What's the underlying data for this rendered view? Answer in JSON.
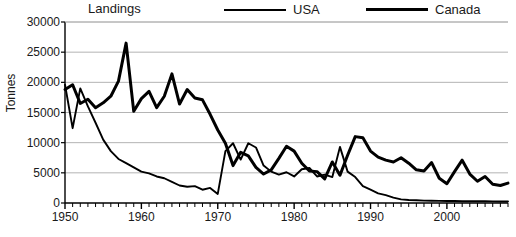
{
  "chart_data": {
    "type": "line",
    "title": "Landings",
    "xlabel": "",
    "ylabel": "Tonnes",
    "xlim": [
      1950,
      2008
    ],
    "ylim": [
      0,
      30000
    ],
    "ytick_labels": [
      "30000",
      "25000",
      "20000",
      "15000",
      "10000",
      "5000",
      "0"
    ],
    "ytick_values": [
      30000,
      25000,
      20000,
      15000,
      10000,
      5000,
      0
    ],
    "xtick_labels": [
      "1950",
      "1960",
      "1970",
      "1980",
      "1990",
      "2000"
    ],
    "xtick_values": [
      1950,
      1960,
      1970,
      1980,
      1990,
      2000
    ],
    "grid": "horizontal",
    "legend_position": "top",
    "x": [
      1950,
      1951,
      1952,
      1953,
      1954,
      1955,
      1956,
      1957,
      1958,
      1959,
      1960,
      1961,
      1962,
      1963,
      1964,
      1965,
      1966,
      1967,
      1968,
      1969,
      1970,
      1971,
      1972,
      1973,
      1974,
      1975,
      1976,
      1977,
      1978,
      1979,
      1980,
      1981,
      1982,
      1983,
      1984,
      1985,
      1986,
      1987,
      1988,
      1989,
      1990,
      1991,
      1992,
      1993,
      1994,
      1995,
      1996,
      1997,
      1998,
      1999,
      2000,
      2001,
      2002,
      2003,
      2004,
      2005,
      2006,
      2007,
      2008
    ],
    "series": [
      {
        "name": "USA",
        "color": "#000000",
        "line_width": 1.9,
        "values": [
          19600,
          12400,
          19000,
          16000,
          13300,
          10500,
          8600,
          7300,
          6600,
          5900,
          5200,
          4900,
          4400,
          4100,
          3500,
          2900,
          2700,
          2800,
          2200,
          2500,
          1500,
          8600,
          9900,
          7200,
          9900,
          9200,
          6200,
          5200,
          4700,
          5100,
          4400,
          5600,
          5800,
          4400,
          4700,
          4300,
          9300,
          5200,
          4300,
          2800,
          2200,
          1600,
          1300,
          900,
          600,
          500,
          450,
          400,
          380,
          350,
          330,
          320,
          300,
          300,
          280,
          280,
          270,
          260,
          250
        ]
      },
      {
        "name": "Canada",
        "color": "#000000",
        "line_width": 3.0,
        "values": [
          18800,
          19600,
          16500,
          17200,
          15800,
          16600,
          17700,
          20200,
          26500,
          15200,
          17300,
          18500,
          15800,
          17700,
          21400,
          16400,
          18800,
          17400,
          17100,
          14700,
          12100,
          9900,
          6200,
          8400,
          7800,
          5900,
          4800,
          5500,
          7400,
          9400,
          8600,
          6600,
          5300,
          5200,
          4000,
          6800,
          4600,
          7900,
          11000,
          10800,
          8600,
          7600,
          7100,
          6800,
          7500,
          6600,
          5500,
          5300,
          6700,
          4100,
          3200,
          5200,
          7100,
          4800,
          3600,
          4400,
          3100,
          2900,
          3300
        ]
      }
    ]
  }
}
